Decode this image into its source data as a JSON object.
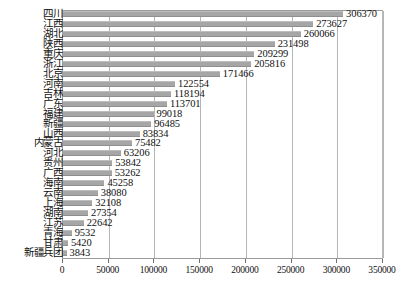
{
  "chart_data": {
    "type": "bar",
    "orientation": "horizontal",
    "title": "",
    "xlabel": "",
    "ylabel": "",
    "xlim": [
      0,
      350000
    ],
    "xticks": [
      0,
      50000,
      100000,
      150000,
      200000,
      250000,
      300000,
      350000
    ],
    "xtick_labels": [
      "0",
      "50000",
      "100000",
      "150000",
      "200000",
      "250000",
      "300000",
      "350000"
    ],
    "grid": true,
    "grid_axis": "x",
    "legend": false,
    "bar_color": "#a6a6a6",
    "show_value_labels": true,
    "categories": [
      "四川",
      "江西",
      "湖北",
      "陕西",
      "重庆",
      "浙江",
      "北京",
      "河南",
      "吉林",
      "广东",
      "福建",
      "新疆",
      "山西",
      "内蒙古",
      "河北",
      "贵州",
      "广西",
      "海南",
      "云南",
      "上海",
      "湖南",
      "江苏",
      "青海",
      "甘肃",
      "新疆兵团"
    ],
    "values": [
      306370,
      273627,
      260066,
      231498,
      209299,
      205816,
      171466,
      122554,
      118194,
      113701,
      99018,
      96485,
      83834,
      75482,
      63206,
      53842,
      53262,
      45258,
      38080,
      32108,
      27354,
      22642,
      9532,
      5420,
      3843
    ],
    "value_labels": [
      "306370",
      "273627",
      "260066",
      "231498",
      "209299",
      "205816",
      "171466",
      "122554",
      "118194",
      "113701",
      "99018",
      "96485",
      "83834",
      "75482",
      "63206",
      "53842",
      "53262",
      "45258",
      "38080",
      "32108",
      "27354",
      "22642",
      "9532",
      "5420",
      "3843"
    ]
  }
}
